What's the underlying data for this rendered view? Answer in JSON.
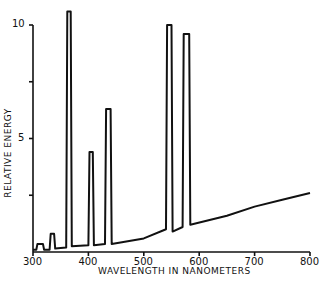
{
  "chart_data": {
    "type": "line",
    "title": "",
    "xlabel": "WAVELENGTH IN NANOMETERS",
    "ylabel": "RELATIVE ENERGY",
    "xlim": [
      300,
      800
    ],
    "ylim": [
      0,
      10
    ],
    "xticks": [
      300,
      400,
      500,
      600,
      700,
      800
    ],
    "yticks": [
      5,
      10
    ],
    "yticks_unlabeled": [
      2.5,
      7.5
    ],
    "grid": false,
    "legend": null,
    "series": [
      {
        "name": "Spectral power distribution",
        "x": [
          300,
          306,
          308,
          318,
          320,
          330,
          332,
          338,
          340,
          360,
          362,
          368,
          370,
          400,
          402,
          408,
          410,
          430,
          432,
          440,
          442,
          500,
          540,
          542,
          550,
          552,
          570,
          572,
          582,
          584,
          650,
          700,
          750,
          800
        ],
        "y": [
          0.1,
          0.1,
          0.35,
          0.35,
          0.1,
          0.1,
          0.8,
          0.8,
          0.15,
          0.2,
          10.6,
          10.6,
          0.25,
          0.3,
          4.4,
          4.4,
          0.3,
          0.35,
          6.3,
          6.3,
          0.35,
          0.6,
          1.0,
          10.0,
          10.0,
          0.9,
          1.1,
          9.6,
          9.6,
          1.2,
          1.6,
          2.0,
          2.3,
          2.6
        ]
      }
    ],
    "peaks_nm": [
      313,
      335,
      365,
      405,
      436,
      546,
      578
    ]
  }
}
